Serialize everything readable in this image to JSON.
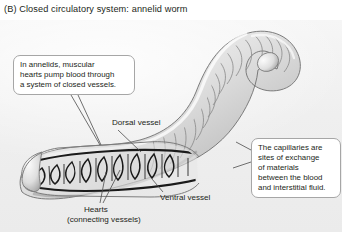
{
  "figure": {
    "panel_letter": "(B)",
    "title": "(B)  Closed circulatory system: annelid worm",
    "organism": "annelid worm",
    "background_color": "#f2f2f2",
    "ink_color": "#231f20"
  },
  "callouts": [
    {
      "id": "closed-vessels",
      "lines": [
        "In annelids, muscular",
        "hearts pump blood through",
        "a system of closed vessels."
      ],
      "text": "In annelids, muscular hearts pump blood through a system of closed vessels."
    },
    {
      "id": "capillary-exchange",
      "lines": [
        "The capillaries are",
        "sites of exchange",
        "of materials",
        "between the blood",
        "and interstitial fluid."
      ],
      "text": "The capillaries are sites of exchange of materials between the blood and interstitial fluid."
    }
  ],
  "labels": {
    "dorsal": "Dorsal vessel",
    "ventral": "Ventral vessel",
    "hearts_line1": "Hearts",
    "hearts_line2": "(connecting vessels)"
  },
  "anatomy": {
    "structures": [
      "dorsal vessel",
      "ventral vessel",
      "hearts (connecting vessels)",
      "capillaries",
      "segmented body wall"
    ],
    "heart_pair_count": 8
  }
}
